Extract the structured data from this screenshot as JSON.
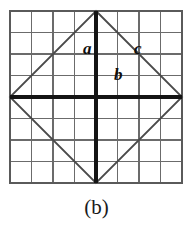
{
  "figure": {
    "caption": "(b)",
    "background_color": "#ffffff",
    "grid": {
      "columns": 8,
      "rows": 8,
      "cell_size": 21.5,
      "origin_x": 10,
      "origin_y": 11,
      "line_color": "#6b6b6b",
      "line_width": 1.4,
      "border_color": "#5a5a5a",
      "border_width": 1.8
    },
    "tilted_square": {
      "stroke_color": "#4a4a4a",
      "stroke_width": 1.8,
      "vertices": [
        {
          "name": "top",
          "x": 96,
          "y": 11
        },
        {
          "name": "right",
          "x": 182,
          "y": 97
        },
        {
          "name": "bottom",
          "x": 96,
          "y": 183
        },
        {
          "name": "left",
          "x": 10,
          "y": 97
        }
      ]
    },
    "bold_segments": {
      "stroke_color": "#141414",
      "stroke_width": 3.4,
      "vertical": {
        "x": 96,
        "y1": 11,
        "y2": 183
      },
      "horizontal": {
        "y": 97,
        "x1": 10,
        "x2": 182
      }
    },
    "labels": [
      {
        "id": "a",
        "text": "a",
        "role": "vertical-leg",
        "x": 83,
        "y": 40
      },
      {
        "id": "b",
        "text": "b",
        "role": "horizontal-leg",
        "x": 114,
        "y": 66
      },
      {
        "id": "c",
        "text": "c",
        "role": "hypotenuse",
        "x": 134,
        "y": 40
      }
    ]
  }
}
